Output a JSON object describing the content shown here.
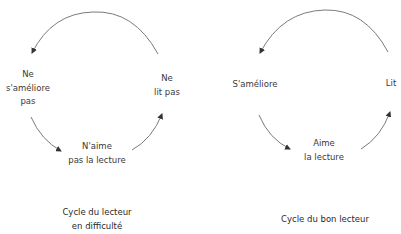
{
  "diagrams": [
    {
      "caption_line1": "Cycle du lecteur",
      "caption_line2": "en difficulté",
      "nodes": {
        "left": {
          "line1": "Ne",
          "line2": "s'améliore",
          "line3": "pas"
        },
        "right": {
          "line1": "Ne",
          "line2": "lit pas"
        },
        "bottom": {
          "line1": "N'aime",
          "line2": "pas la lecture"
        }
      }
    },
    {
      "caption_line1": "Cycle du bon lecteur",
      "nodes": {
        "left": {
          "line1": "S'améliore"
        },
        "right": {
          "line1": "Lit"
        },
        "bottom": {
          "line1": "Aime",
          "line2": "la lecture"
        }
      }
    }
  ],
  "colors": {
    "arc": "#6b6b6b",
    "text": "#333333"
  }
}
